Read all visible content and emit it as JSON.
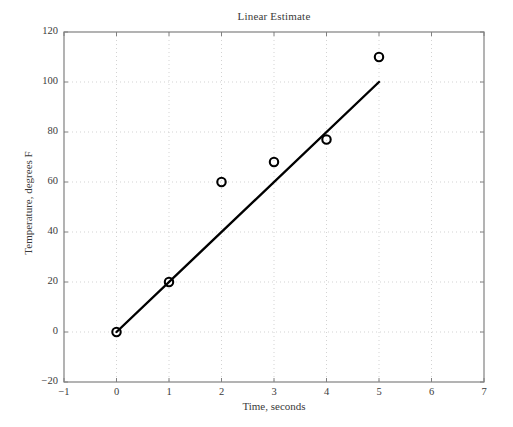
{
  "chart_data": {
    "type": "scatter",
    "title": "Linear Estimate",
    "xlabel": "Time, seconds",
    "ylabel": "Temperature, degrees F",
    "xlim": [
      -1,
      7
    ],
    "ylim": [
      -20,
      120
    ],
    "xticks": [
      -1,
      0,
      1,
      2,
      3,
      4,
      5,
      6,
      7
    ],
    "xtick_labels": [
      "−1",
      "0",
      "1",
      "2",
      "3",
      "4",
      "5",
      "6",
      "7"
    ],
    "yticks": [
      -20,
      0,
      20,
      40,
      60,
      80,
      100,
      120
    ],
    "ytick_labels": [
      "−20",
      "0",
      "20",
      "40",
      "60",
      "80",
      "100",
      "120"
    ],
    "grid": true,
    "grid_style": "dotted",
    "grid_color": "#c8c8c8",
    "axis_color": "#808080",
    "legend": null,
    "series": [
      {
        "name": "Measured data",
        "type": "scatter",
        "marker": "open-circle",
        "color": "#000000",
        "x": [
          0,
          1,
          2,
          3,
          4,
          5
        ],
        "values": [
          0,
          20,
          60,
          68,
          77,
          110
        ]
      },
      {
        "name": "Linear estimate",
        "type": "line",
        "color": "#000000",
        "x": [
          0,
          5
        ],
        "values": [
          0,
          100
        ]
      }
    ]
  },
  "figure": {
    "background": "#ffffff",
    "title": "Linear Estimate",
    "xlabel": "Time, seconds",
    "ylabel": "Temperature, degrees F"
  }
}
